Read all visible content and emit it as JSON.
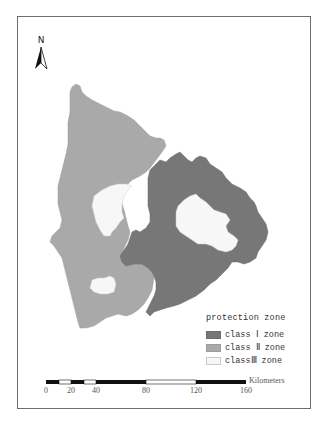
{
  "map": {
    "north_arrow": {
      "label": "N",
      "icon": "north-arrow-icon"
    },
    "legend": {
      "title": "protection zone",
      "items": [
        {
          "label": "class Ⅰ zone",
          "color": "#777777"
        },
        {
          "label": "class Ⅱ zone",
          "color": "#a9a9a9"
        },
        {
          "label": "classⅢ zone",
          "color": "#f7f7f7"
        }
      ]
    },
    "scale_bar": {
      "unit": "Kilometers",
      "ticks": [
        "0",
        "20",
        "40",
        "80",
        "120",
        "160"
      ]
    },
    "colors": {
      "class_1": "#777777",
      "class_2": "#a9a9a9",
      "class_3": "#f7f7f7",
      "frame": "#6e6e6e"
    }
  }
}
